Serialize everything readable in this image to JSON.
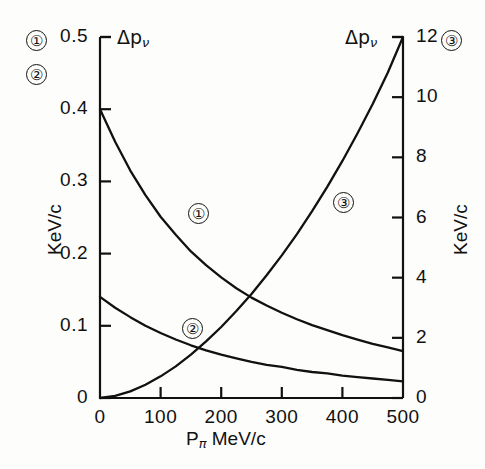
{
  "chart_data": {
    "type": "line",
    "title": "",
    "xlabel": "P_pi  MeV/c",
    "xlabel_base": "P",
    "xlabel_sub": "π",
    "xlabel_unit": "MeV/c",
    "ylabel_left": "KeV/c",
    "ylabel_right": "KeV/c",
    "y_axis_symbol_left": "Δp",
    "y_axis_symbol_left_sub": "ν",
    "y_axis_symbol_right": "Δp",
    "y_axis_symbol_right_sub": "ν",
    "xlim": [
      0,
      500
    ],
    "ylim_left": [
      0,
      0.5
    ],
    "ylim_right": [
      0,
      12
    ],
    "xticks": [
      0,
      100,
      200,
      300,
      400,
      500
    ],
    "xtick_labels": [
      "0",
      "100",
      "200",
      "300",
      "400",
      "500"
    ],
    "yticks_left": [
      0,
      0.1,
      0.2,
      0.3,
      0.4,
      0.5
    ],
    "ytick_labels_left": [
      "0",
      "0.1",
      "0.2",
      "0.3",
      "0.4",
      "0.5"
    ],
    "yticks_right": [
      0,
      2,
      4,
      6,
      8,
      10,
      12
    ],
    "ytick_labels_right": [
      "0",
      "2",
      "4",
      "6",
      "8",
      "10",
      "12"
    ],
    "grid": false,
    "legend": "inline-circled-numbers",
    "x": [
      0,
      25,
      50,
      75,
      100,
      125,
      150,
      175,
      200,
      225,
      250,
      275,
      300,
      325,
      350,
      375,
      400,
      425,
      450,
      475,
      500
    ],
    "series": [
      {
        "name": "1",
        "label": "①",
        "axis": "left",
        "units": "KeV/c",
        "values": [
          0.4,
          0.355,
          0.315,
          0.281,
          0.251,
          0.226,
          0.203,
          0.184,
          0.167,
          0.152,
          0.139,
          0.128,
          0.118,
          0.109,
          0.101,
          0.094,
          0.087,
          0.081,
          0.075,
          0.07,
          0.065
        ],
        "tag_x": 160,
        "tag_y": 0.258
      },
      {
        "name": "2",
        "label": "②",
        "axis": "left",
        "units": "KeV/c",
        "values": [
          0.14,
          0.125,
          0.112,
          0.1,
          0.09,
          0.081,
          0.073,
          0.066,
          0.06,
          0.055,
          0.05,
          0.046,
          0.043,
          0.039,
          0.036,
          0.034,
          0.031,
          0.029,
          0.027,
          0.025,
          0.023
        ],
        "tag_x": 150,
        "tag_y": 0.098
      },
      {
        "name": "3",
        "label": "③",
        "axis": "right",
        "units": "KeV/c",
        "values": [
          0.0,
          0.07,
          0.22,
          0.44,
          0.72,
          1.05,
          1.44,
          1.88,
          2.36,
          2.89,
          3.46,
          4.08,
          4.74,
          5.45,
          6.21,
          7.02,
          7.88,
          8.8,
          9.77,
          10.82,
          12.0
        ],
        "tag_x": 400,
        "tag_y": 6.55
      }
    ],
    "legend_markers_top": [
      {
        "label": "①",
        "position": "top-left"
      },
      {
        "label": "②",
        "position": "top-left-below"
      },
      {
        "label": "③",
        "position": "top-right"
      }
    ]
  }
}
